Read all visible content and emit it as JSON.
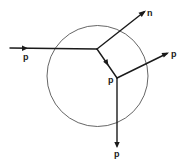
{
  "diagram": {
    "colors": {
      "line": "#1a1a1a",
      "circle": "#555555",
      "background": "#ffffff"
    },
    "nodes": {
      "vertex_a": {
        "label": ""
      },
      "vertex_b": {
        "label": "p"
      }
    },
    "rays": [
      {
        "id": "incoming",
        "label": "p",
        "direction": "into vertex_a from left"
      },
      {
        "id": "outgoing-n",
        "label": "n",
        "direction": "from vertex_a up-right"
      },
      {
        "id": "internal",
        "label": "",
        "direction": "from vertex_a to vertex_b"
      },
      {
        "id": "outgoing-right",
        "label": "p",
        "direction": "from vertex_b right"
      },
      {
        "id": "outgoing-down",
        "label": "p",
        "direction": "from vertex_b down"
      }
    ],
    "labels": {
      "incoming": "p",
      "outgoing_n": "n",
      "vertex_b": "p",
      "outgoing_right": "p",
      "outgoing_down": "p"
    }
  }
}
